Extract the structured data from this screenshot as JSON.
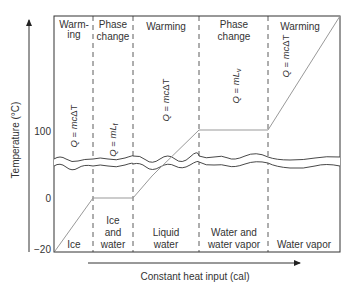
{
  "y_axis": {
    "label": "Temperature (°C)",
    "ticks": [
      {
        "label": "100",
        "value": 100
      },
      {
        "label": "0",
        "value": 0
      },
      {
        "label": "−20",
        "value": -20
      }
    ]
  },
  "x_axis": {
    "label": "Constant heat input (cal)"
  },
  "regions": [
    {
      "header_line1": "Warm-",
      "header_line2": "ing",
      "equation": "Q = mcΔT",
      "state": "Ice",
      "state_line2": ""
    },
    {
      "header_line1": "Phase",
      "header_line2": "change",
      "equation": "Q = mLf",
      "state": "Ice",
      "state_line2": "and",
      "state_line3": "water"
    },
    {
      "header_line1": "Warming",
      "header_line2": "",
      "equation": "Q = mcΔT",
      "state": "Liquid",
      "state_line2": "water"
    },
    {
      "header_line1": "Phase",
      "header_line2": "change",
      "equation": "Q = mLv",
      "state": "Water and",
      "state_line2": "water vapor"
    },
    {
      "header_line1": "Warming",
      "header_line2": "",
      "equation": "Q = mcΔT",
      "state": "Water vapor",
      "state_line2": ""
    }
  ],
  "equations": {
    "q": "Q",
    "eq": " = ",
    "mc": "mc",
    "delta_t": "ΔT",
    "m": "mL",
    "f": "f",
    "v": "v"
  },
  "colors": {
    "line": "#999999",
    "frame": "#333333",
    "text": "#333333"
  }
}
